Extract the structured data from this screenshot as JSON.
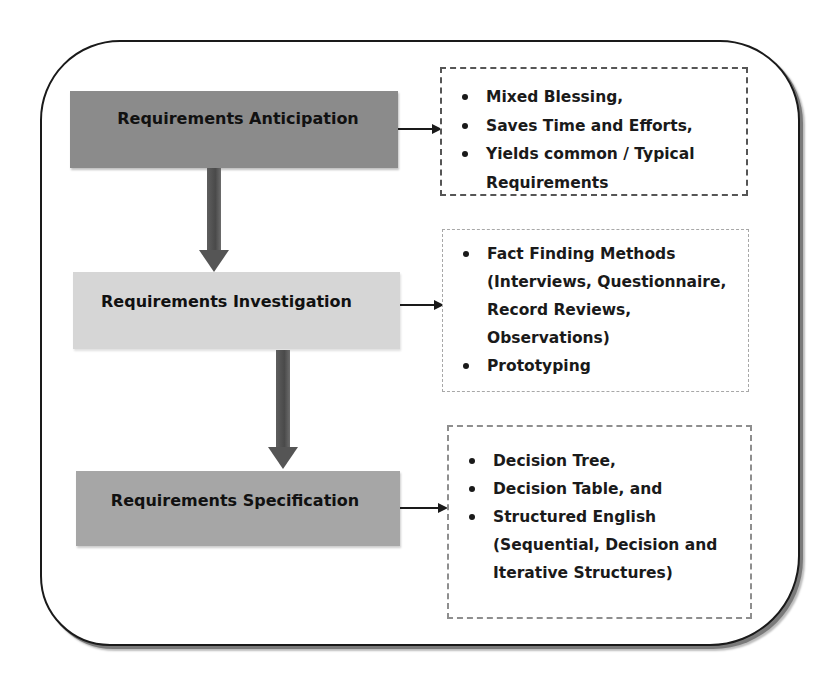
{
  "diagram": {
    "stages": [
      {
        "label": "Requirements Anticipation",
        "fill": "#8b8b8b",
        "notes": [
          "Mixed Blessing,",
          "Saves Time and Efforts,",
          "Yields common / Typical Requirements"
        ]
      },
      {
        "label": "Requirements Investigation",
        "fill": "#d6d6d6",
        "notes": [
          "Fact Finding Methods (Interviews, Questionnaire, Record Reviews, Observations)",
          "Prototyping"
        ]
      },
      {
        "label": "Requirements Specification",
        "fill": "#a6a6a6",
        "notes": [
          "Decision Tree,",
          "Decision Table, and",
          "Structured English (Sequential, Decision and Iterative Structures)"
        ]
      }
    ],
    "flow": [
      {
        "from": "Requirements Anticipation",
        "to": "Requirements Investigation"
      },
      {
        "from": "Requirements Investigation",
        "to": "Requirements Specification"
      }
    ],
    "colors": {
      "frame_border": "#1a1a1a",
      "arrow_fill": "#555555",
      "text": "#111111"
    }
  }
}
